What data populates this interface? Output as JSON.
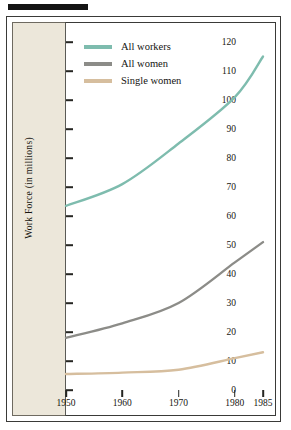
{
  "chart_data": {
    "type": "line",
    "title": "",
    "xlabel": "",
    "ylabel": "Work Force (in millions)",
    "x": [
      1950,
      1960,
      1970,
      1980,
      1985
    ],
    "xticklabels": [
      "1950",
      "1960",
      "1970",
      "1980",
      "1985"
    ],
    "xlim": [
      1950,
      1985
    ],
    "ylim": [
      0,
      120
    ],
    "yticks": [
      0,
      10,
      20,
      30,
      40,
      50,
      60,
      70,
      80,
      90,
      100,
      110,
      120
    ],
    "yticklabels": [
      "0",
      "10",
      "20",
      "30",
      "40",
      "50",
      "60",
      "70",
      "80",
      "90",
      "100",
      "110",
      "120"
    ],
    "grid": false,
    "legend_position": "top-left",
    "series": [
      {
        "name": "All workers",
        "color": "#7ebcae",
        "values": [
          63.5,
          71,
          85,
          101,
          115
        ]
      },
      {
        "name": "All women",
        "color": "#8c8c88",
        "values": [
          18,
          23,
          30,
          44,
          51
        ]
      },
      {
        "name": "Single women",
        "color": "#d6be9e",
        "values": [
          5.5,
          6,
          7,
          11,
          13
        ]
      }
    ]
  },
  "legend": {
    "items": [
      {
        "label": "All workers",
        "color": "#7ebcae"
      },
      {
        "label": "All women",
        "color": "#8c8c88"
      },
      {
        "label": "Single women",
        "color": "#d6be9e"
      }
    ]
  },
  "colors": {
    "page_background": "#ffffff",
    "axis_band": "#ece7da",
    "frame": "#3a3a38",
    "top_bar": "#141414",
    "text": "#16150f"
  }
}
